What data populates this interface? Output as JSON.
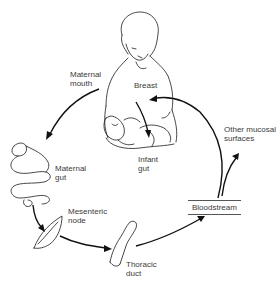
{
  "diagram": {
    "labels": {
      "maternal_mouth": [
        "Maternal",
        "mouth"
      ],
      "breast": "Breast",
      "infant_gut": [
        "Infant",
        "gut"
      ],
      "maternal_gut": [
        "Maternal",
        "gut"
      ],
      "mesenteric_node": [
        "Mesenteric",
        "node"
      ],
      "thoracic_duct": [
        "Thoracic",
        "duct"
      ],
      "bloodstream": "Bloodstream",
      "other_mucosal_surfaces": [
        "Other mucosal",
        "surfaces"
      ]
    },
    "flow": [
      "Maternal mouth",
      "Maternal gut",
      "Mesenteric node",
      "Thoracic duct",
      "Bloodstream",
      "Breast",
      "Infant gut"
    ],
    "branch": {
      "from": "Bloodstream",
      "to": "Other mucosal surfaces"
    },
    "colors": {
      "ink": "#1a1a1a",
      "label": "#3a3a3a",
      "background": "#ffffff"
    }
  }
}
